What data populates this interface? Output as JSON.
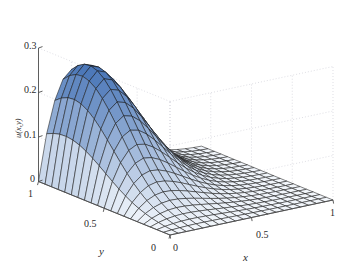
{
  "figure": {
    "kind": "3d-surface-mesh-plot",
    "background_color": "#ffffff",
    "mesh_line_color": "#1a1a1a",
    "axis_line_color": "#4d4d4d",
    "grid_color": "#d0d0d8",
    "text_color": "#2b2b2b"
  },
  "axes": {
    "z": {
      "label": "u(x,y)",
      "ticks": [
        "0.3",
        "0.2",
        "0.1",
        "0"
      ],
      "tick_values": [
        0.3,
        0.2,
        0.1,
        0
      ],
      "range": [
        0,
        0.3
      ]
    },
    "y": {
      "label": "y",
      "ticks": [
        "1",
        "0.5",
        "0"
      ],
      "tick_values": [
        1,
        0.5,
        0
      ],
      "range": [
        0,
        1
      ],
      "direction": "decreasing-left-to-right"
    },
    "x": {
      "label": "x",
      "ticks": [
        "0",
        "0.5",
        "1"
      ],
      "tick_values": [
        0,
        0.5,
        1
      ],
      "range": [
        0,
        1
      ],
      "direction": "increasing-left-to-right"
    }
  },
  "chart_data": {
    "type": "surface",
    "title": "",
    "xlabel": "x",
    "ylabel": "y",
    "zlabel": "u(x,y)",
    "xlim": [
      0,
      1
    ],
    "ylim": [
      0,
      1
    ],
    "zlim": [
      0,
      0.3
    ],
    "xticks": [
      0,
      0.5,
      1
    ],
    "yticks": [
      0,
      0.5,
      1
    ],
    "zticks": [
      0,
      0.1,
      0.2,
      0.3
    ],
    "grid": true,
    "legend": "none",
    "colormap": "blues-light-to-medium",
    "colormap_low": "#f2f6fb",
    "colormap_high": "#2f62ad",
    "mesh_nx": 21,
    "mesh_ny": 21,
    "peak": {
      "x": 0.18,
      "y": 0.86,
      "z": 0.295
    },
    "surface_model": "u(x,y) = 0.295 * exp(-((x-0.18)^2)/(2*0.255^2)) * exp(-((y-0.86)^2)/(2*0.30^2)) tapered to 0 on x=0, y=0 boundaries",
    "z_at_corners": {
      "x0_y0": 0.0,
      "x0_y1": 0.0,
      "x1_y0": 0.0,
      "x1_y1": 0.01
    },
    "sample_profile_along_y_at_x_0_18": [
      {
        "y": 0.0,
        "z": 0.0
      },
      {
        "y": 0.1,
        "z": 0.03
      },
      {
        "y": 0.2,
        "z": 0.07
      },
      {
        "y": 0.3,
        "z": 0.12
      },
      {
        "y": 0.4,
        "z": 0.175
      },
      {
        "y": 0.5,
        "z": 0.225
      },
      {
        "y": 0.6,
        "z": 0.262
      },
      {
        "y": 0.7,
        "z": 0.285
      },
      {
        "y": 0.8,
        "z": 0.294
      },
      {
        "y": 0.9,
        "z": 0.291
      },
      {
        "y": 1.0,
        "z": 0.27
      }
    ],
    "sample_profile_along_x_at_y_0_86": [
      {
        "x": 0.0,
        "z": 0.0
      },
      {
        "x": 0.1,
        "z": 0.24
      },
      {
        "x": 0.2,
        "z": 0.295
      },
      {
        "x": 0.3,
        "z": 0.275
      },
      {
        "x": 0.4,
        "z": 0.22
      },
      {
        "x": 0.5,
        "z": 0.155
      },
      {
        "x": 0.6,
        "z": 0.095
      },
      {
        "x": 0.7,
        "z": 0.055
      },
      {
        "x": 0.8,
        "z": 0.028
      },
      {
        "x": 0.9,
        "z": 0.013
      },
      {
        "x": 1.0,
        "z": 0.005
      }
    ]
  },
  "labels": {
    "z_tick_0_3": "0.3",
    "z_tick_0_2": "0.2",
    "z_tick_0_1": "0.1",
    "z_tick_0": "0",
    "z_name": "u(x,y)",
    "y_tick_1": "1",
    "y_tick_0_5": "0.5",
    "y_tick_0": "0",
    "y_name": "y",
    "x_tick_0": "0",
    "x_tick_0_5": "0.5",
    "x_tick_1": "1",
    "x_name": "x"
  }
}
